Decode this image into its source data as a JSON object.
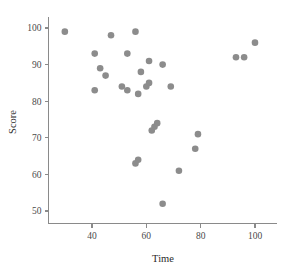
{
  "chart_data": {
    "type": "scatter",
    "title": "",
    "xlabel": "Time",
    "ylabel": "Score",
    "xlim": [
      25,
      108
    ],
    "ylim": [
      47,
      103
    ],
    "xticks": [
      40,
      60,
      80,
      100
    ],
    "yticks": [
      50,
      60,
      70,
      80,
      90,
      100
    ],
    "xtick_labels": [
      "40",
      "60",
      "80",
      "100"
    ],
    "ytick_labels": [
      "50",
      "60",
      "70",
      "80",
      "90",
      "100"
    ],
    "grid": false,
    "legend": null,
    "marker": {
      "shape": "circle",
      "color": "#8c8c8c",
      "size": 4.2
    },
    "series": [
      {
        "name": "observations",
        "points": [
          {
            "x": 30,
            "y": 99
          },
          {
            "x": 41,
            "y": 93
          },
          {
            "x": 41,
            "y": 83
          },
          {
            "x": 43,
            "y": 89
          },
          {
            "x": 45,
            "y": 87
          },
          {
            "x": 47,
            "y": 98
          },
          {
            "x": 51,
            "y": 84
          },
          {
            "x": 53,
            "y": 83
          },
          {
            "x": 53,
            "y": 93
          },
          {
            "x": 56,
            "y": 99
          },
          {
            "x": 56,
            "y": 63
          },
          {
            "x": 57,
            "y": 64
          },
          {
            "x": 57,
            "y": 82
          },
          {
            "x": 58,
            "y": 88
          },
          {
            "x": 60,
            "y": 84
          },
          {
            "x": 61,
            "y": 85
          },
          {
            "x": 61,
            "y": 91
          },
          {
            "x": 62,
            "y": 72
          },
          {
            "x": 63,
            "y": 73
          },
          {
            "x": 64,
            "y": 74
          },
          {
            "x": 66,
            "y": 52
          },
          {
            "x": 66,
            "y": 90
          },
          {
            "x": 69,
            "y": 84
          },
          {
            "x": 72,
            "y": 61
          },
          {
            "x": 78,
            "y": 67
          },
          {
            "x": 79,
            "y": 71
          },
          {
            "x": 93,
            "y": 92
          },
          {
            "x": 96,
            "y": 92
          },
          {
            "x": 100,
            "y": 96
          }
        ]
      }
    ]
  },
  "axes": {
    "x_title": "Time",
    "y_title": "Score"
  },
  "colors": {
    "marker": "#8c8c8c",
    "axis": "#8a8a8a",
    "tick_text": "#4a4a4a",
    "title_text": "#2b2b2b",
    "background": "#ffffff"
  }
}
